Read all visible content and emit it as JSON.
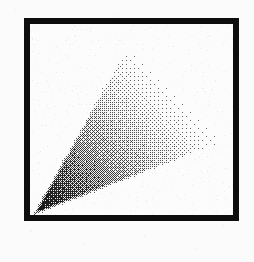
{
  "figure": {
    "title": "Gouraud shaded triangle",
    "caption": "",
    "canvas_width": 254,
    "canvas_height": 262,
    "page_background_color": "#fbfbfb"
  },
  "frame": {
    "name": "image-border",
    "x": 24,
    "y": 18,
    "width": 215,
    "height": 203,
    "border_thickness": 6,
    "border_color": "#0d0d0d",
    "fill_color": "#fcfcfc"
  },
  "render": {
    "name": "dithered-gouraud-triangle",
    "shading_model": "gouraud",
    "dither": "ordered",
    "background_color": "#fcfcfc",
    "viewport": {
      "x": 30,
      "y": 24,
      "width": 203,
      "height": 191
    },
    "vertices": [
      {
        "label": "apex-bottom-left",
        "x": 32,
        "y": 216,
        "intensity": 0.0,
        "color": "#000000"
      },
      {
        "label": "vertex-top",
        "x": 130,
        "y": 40,
        "intensity": 1.0,
        "color": "#ffffff"
      },
      {
        "label": "vertex-right",
        "x": 228,
        "y": 141,
        "intensity": 1.0,
        "color": "#ffffff"
      }
    ],
    "edge_fade": true,
    "ink_color": "#141414"
  }
}
